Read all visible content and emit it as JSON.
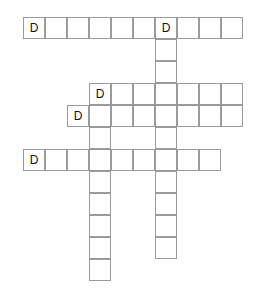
{
  "puzzle": {
    "title": "Crossword Grid",
    "cell_size": 22,
    "origin_x": 23,
    "origin_y": 17,
    "grid_color": "#9a9a9a",
    "letter_color": "#111111",
    "background": "#ffffff",
    "entries": [
      {
        "id": "across-1",
        "direction": "across",
        "row": 0,
        "col": 0,
        "length": 10,
        "start_letter": "D"
      },
      {
        "id": "down-1",
        "direction": "down",
        "row": 0,
        "col": 6,
        "length": 11,
        "start_letter": "D"
      },
      {
        "id": "across-2",
        "direction": "across",
        "row": 3,
        "col": 3,
        "length": 7,
        "start_letter": "D"
      },
      {
        "id": "down-2",
        "direction": "down",
        "row": 3,
        "col": 3,
        "length": 9,
        "start_letter": "D"
      },
      {
        "id": "across-3",
        "direction": "across",
        "row": 4,
        "col": 2,
        "length": 8,
        "start_letter": "D"
      },
      {
        "id": "across-4",
        "direction": "across",
        "row": 6,
        "col": 0,
        "length": 9,
        "start_letter": "D"
      }
    ],
    "cells": [
      {
        "row": 0,
        "col": 0,
        "letter": "D"
      },
      {
        "row": 0,
        "col": 1,
        "letter": ""
      },
      {
        "row": 0,
        "col": 2,
        "letter": ""
      },
      {
        "row": 0,
        "col": 3,
        "letter": ""
      },
      {
        "row": 0,
        "col": 4,
        "letter": ""
      },
      {
        "row": 0,
        "col": 5,
        "letter": ""
      },
      {
        "row": 0,
        "col": 6,
        "letter": "D"
      },
      {
        "row": 0,
        "col": 7,
        "letter": ""
      },
      {
        "row": 0,
        "col": 8,
        "letter": ""
      },
      {
        "row": 0,
        "col": 9,
        "letter": ""
      },
      {
        "row": 1,
        "col": 6,
        "letter": ""
      },
      {
        "row": 2,
        "col": 6,
        "letter": ""
      },
      {
        "row": 3,
        "col": 3,
        "letter": "D"
      },
      {
        "row": 3,
        "col": 4,
        "letter": ""
      },
      {
        "row": 3,
        "col": 5,
        "letter": ""
      },
      {
        "row": 3,
        "col": 6,
        "letter": ""
      },
      {
        "row": 3,
        "col": 7,
        "letter": ""
      },
      {
        "row": 3,
        "col": 8,
        "letter": ""
      },
      {
        "row": 3,
        "col": 9,
        "letter": ""
      },
      {
        "row": 4,
        "col": 2,
        "letter": "D"
      },
      {
        "row": 4,
        "col": 3,
        "letter": ""
      },
      {
        "row": 4,
        "col": 4,
        "letter": ""
      },
      {
        "row": 4,
        "col": 5,
        "letter": ""
      },
      {
        "row": 4,
        "col": 6,
        "letter": ""
      },
      {
        "row": 4,
        "col": 7,
        "letter": ""
      },
      {
        "row": 4,
        "col": 8,
        "letter": ""
      },
      {
        "row": 4,
        "col": 9,
        "letter": ""
      },
      {
        "row": 5,
        "col": 3,
        "letter": ""
      },
      {
        "row": 5,
        "col": 6,
        "letter": ""
      },
      {
        "row": 6,
        "col": 0,
        "letter": "D"
      },
      {
        "row": 6,
        "col": 1,
        "letter": ""
      },
      {
        "row": 6,
        "col": 2,
        "letter": ""
      },
      {
        "row": 6,
        "col": 3,
        "letter": ""
      },
      {
        "row": 6,
        "col": 4,
        "letter": ""
      },
      {
        "row": 6,
        "col": 5,
        "letter": ""
      },
      {
        "row": 6,
        "col": 6,
        "letter": ""
      },
      {
        "row": 6,
        "col": 7,
        "letter": ""
      },
      {
        "row": 6,
        "col": 8,
        "letter": ""
      },
      {
        "row": 7,
        "col": 3,
        "letter": ""
      },
      {
        "row": 7,
        "col": 6,
        "letter": ""
      },
      {
        "row": 8,
        "col": 3,
        "letter": ""
      },
      {
        "row": 8,
        "col": 6,
        "letter": ""
      },
      {
        "row": 9,
        "col": 3,
        "letter": ""
      },
      {
        "row": 9,
        "col": 6,
        "letter": ""
      },
      {
        "row": 10,
        "col": 3,
        "letter": ""
      },
      {
        "row": 10,
        "col": 6,
        "letter": ""
      },
      {
        "row": 11,
        "col": 3,
        "letter": ""
      }
    ]
  }
}
